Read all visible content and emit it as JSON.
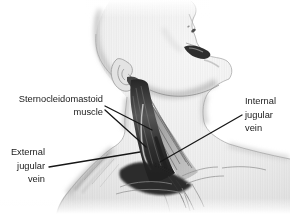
{
  "illustration": {
    "description": "Anatomical illustration of a head tilted back exposing the neck, showing the sternocleidomastoid muscle and the internal and external jugular veins",
    "colors": {
      "background": "#ffffff",
      "text": "#1a1a1a",
      "leader_line": "#161616",
      "skin_highlight": "#f7f7f7",
      "skin_base": "#e6e6e6",
      "skin_shadow": "#c6c6c6",
      "muscle_dark": "#222222",
      "muscle_mid": "#6a6a6a",
      "vein_highlight": "#cccccc"
    },
    "labels": {
      "sternocleidomastoid": {
        "line1": "Sternocleidomastoid",
        "line2": "muscle"
      },
      "internal_jugular": {
        "line1": "Internal",
        "line2": "jugular",
        "line3": "vein"
      },
      "external_jugular": {
        "line1": "External",
        "line2": "jugular",
        "line3": "vein"
      }
    }
  }
}
